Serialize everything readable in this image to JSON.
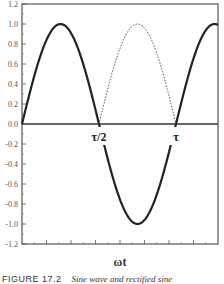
{
  "chart_data": {
    "type": "line",
    "title": "",
    "xlabel": "ωt",
    "ylabel": "",
    "ylim": [
      -1.2,
      1.2
    ],
    "xlim_periods": [
      0,
      1.26
    ],
    "grid": false,
    "yticks": [
      "1.2",
      "1.0",
      "0.8",
      "0.6",
      "0.4",
      "0.2",
      "0.0",
      "-0.2",
      "-0.4",
      "-0.6",
      "-0.8",
      "-1.0",
      "-1.2"
    ],
    "ytick_values": [
      1.2,
      1.0,
      0.8,
      0.6,
      0.4,
      0.2,
      0.0,
      -0.2,
      -0.4,
      -0.6,
      -0.8,
      -1.0,
      -1.2
    ],
    "x_annotations": [
      {
        "label": "τ/2",
        "x_period": 0.5
      },
      {
        "label": "τ",
        "x_period": 1.0
      }
    ],
    "series": [
      {
        "name": "sine wave",
        "style": "solid",
        "description": "sin(ωt): positive lobe 0–τ/2, negative lobe τ/2–τ, rising again after τ",
        "x_period": [
          0,
          0.125,
          0.25,
          0.375,
          0.5,
          0.625,
          0.75,
          0.875,
          1.0,
          1.125,
          1.25
        ],
        "values": [
          0.0,
          0.71,
          1.0,
          0.71,
          0.0,
          -0.71,
          -1.0,
          -0.71,
          0.0,
          0.71,
          1.0
        ]
      },
      {
        "name": "rectified sine (inverted half)",
        "style": "dashed",
        "description": "|sin(ωt)| over τ/2–τ",
        "x_period": [
          0.5,
          0.625,
          0.75,
          0.875,
          1.0
        ],
        "values": [
          0.0,
          0.71,
          1.0,
          0.71,
          0.0
        ]
      }
    ]
  },
  "caption": {
    "figure": "FIGURE 17.2",
    "text": "Sine wave and rectified sine"
  }
}
